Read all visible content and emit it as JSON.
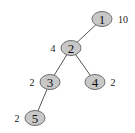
{
  "tree": {
    "nodes": [
      {
        "id": "1",
        "label": "1",
        "weight": "10",
        "weight_side": "right"
      },
      {
        "id": "2",
        "label": "2",
        "weight": "4",
        "weight_side": "left"
      },
      {
        "id": "3",
        "label": "3",
        "weight": "2",
        "weight_side": "left"
      },
      {
        "id": "4",
        "label": "4",
        "weight": "2",
        "weight_side": "right"
      },
      {
        "id": "5",
        "label": "5",
        "weight": "2",
        "weight_side": "left"
      }
    ],
    "edges": [
      {
        "from": "1",
        "to": "2"
      },
      {
        "from": "2",
        "to": "3"
      },
      {
        "from": "2",
        "to": "4"
      },
      {
        "from": "3",
        "to": "5"
      }
    ],
    "colors": {
      "node_fill": "#c8c8c8",
      "node_stroke": "#6e6e6e",
      "edge": "#555555"
    }
  }
}
